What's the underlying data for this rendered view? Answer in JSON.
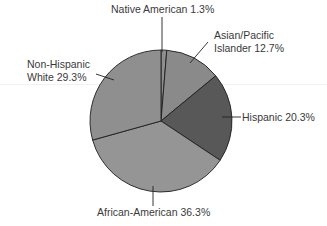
{
  "chart_data": {
    "type": "pie",
    "title": "",
    "start_angle_deg": 0,
    "direction": "clockwise",
    "slices": [
      {
        "label": "Native American",
        "value": 1.3,
        "display": "Native American 1.3%",
        "color": "#8e8e8e"
      },
      {
        "label": "Asian/Pacific Islander",
        "value": 12.7,
        "display_lines": [
          "Asian/Pacific",
          "Islander 12.7%"
        ],
        "color": "#8a8a8a"
      },
      {
        "label": "Hispanic",
        "value": 20.3,
        "display": "Hispanic 20.3%",
        "color": "#585858"
      },
      {
        "label": "African-American",
        "value": 36.3,
        "display": "African-American 36.3%",
        "color": "#959595"
      },
      {
        "label": "Non-Hispanic White",
        "value": 29.3,
        "display_lines": [
          "Non-Hispanic",
          "White 29.3%"
        ],
        "color": "#8f8f8f"
      }
    ],
    "legend": "none (direct labels with leader lines)"
  },
  "labels": {
    "native": "Native American 1.3%",
    "asian_1": "Asian/Pacific",
    "asian_2": "Islander 12.7%",
    "hispanic": "Hispanic 20.3%",
    "african": "African-American 36.3%",
    "white_1": "Non-Hispanic",
    "white_2": "White 29.3%"
  }
}
